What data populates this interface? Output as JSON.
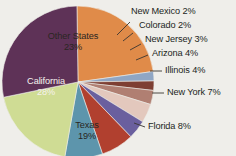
{
  "chart_data": {
    "type": "pie",
    "title": "",
    "subtitle": "",
    "xlabel": "",
    "ylabel": "",
    "legend_position": "callout-labels-right",
    "grid": false,
    "unit": "%",
    "categories": [
      "Other States",
      "New Mexico",
      "Colorado",
      "New Jersey",
      "Arizona",
      "Illinois",
      "New York",
      "Florida",
      "Texas",
      "California"
    ],
    "values": [
      23,
      2,
      2,
      3,
      4,
      4,
      7,
      8,
      19,
      28
    ],
    "colors": [
      "#e08b49",
      "#8fa6c4",
      "#7e3f33",
      "#b07f72",
      "#e3c8bd",
      "#6a5f9e",
      "#b1402f",
      "#5d95ac",
      "#cfdc94",
      "#5e3257"
    ],
    "slices": [
      {
        "label": "Other States",
        "value": 23,
        "value_text": "23%",
        "color": "#e08b49",
        "label_placement": "inside",
        "label_color": "dark"
      },
      {
        "label": "New Mexico",
        "value": 2,
        "value_text": "2%",
        "color": "#8fa6c4",
        "label_placement": "callout",
        "label_color": "dark"
      },
      {
        "label": "Colorado",
        "value": 2,
        "value_text": "2%",
        "color": "#7e3f33",
        "label_placement": "callout",
        "label_color": "dark"
      },
      {
        "label": "New Jersey",
        "value": 3,
        "value_text": "3%",
        "color": "#b07f72",
        "label_placement": "callout",
        "label_color": "dark"
      },
      {
        "label": "Arizona",
        "value": 4,
        "value_text": "4%",
        "color": "#e3c8bd",
        "label_placement": "callout",
        "label_color": "dark"
      },
      {
        "label": "Illinois",
        "value": 4,
        "value_text": "4%",
        "color": "#6a5f9e",
        "label_placement": "callout",
        "label_color": "dark"
      },
      {
        "label": "New York",
        "value": 7,
        "value_text": "7%",
        "color": "#b1402f",
        "label_placement": "callout",
        "label_color": "dark"
      },
      {
        "label": "Florida",
        "value": 8,
        "value_text": "8%",
        "color": "#5d95ac",
        "label_placement": "callout",
        "label_color": "dark"
      },
      {
        "label": "Texas",
        "value": 19,
        "value_text": "19%",
        "color": "#cfdc94",
        "label_placement": "inside",
        "label_color": "dark"
      },
      {
        "label": "California",
        "value": 28,
        "value_text": "28%",
        "color": "#5e3257",
        "label_placement": "inside",
        "label_color": "light"
      }
    ]
  },
  "labels": {
    "other_states_name": "Other States",
    "other_states_value": "23%",
    "california_name": "California",
    "california_value": "28%",
    "texas_name": "Texas",
    "texas_value": "19%",
    "new_mexico": "New Mexico 2%",
    "colorado": "Colorado 2%",
    "new_jersey": "New Jersey 3%",
    "arizona": "Arizona 4%",
    "illinois": "Illinois 4%",
    "new_york": "New York 7%",
    "florida": "Florida 8%"
  },
  "background_color": "#efeeea"
}
